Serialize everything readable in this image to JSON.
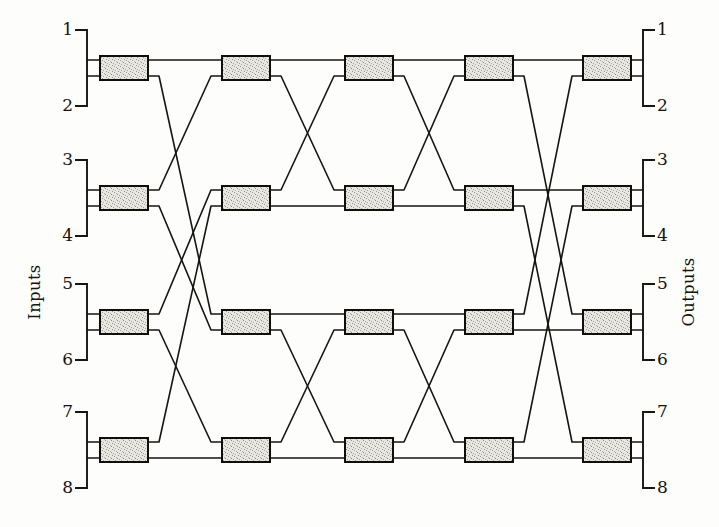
{
  "figure": {
    "kind": "benes-network",
    "stage_count": 5,
    "switches_per_stage": 4,
    "line_color": "#17150f",
    "box_fill": "#e9e7e1",
    "background": "#fdfdfc"
  },
  "labels": {
    "inputs_label": "Inputs",
    "outputs_label": "Outputs"
  },
  "inputs": [
    {
      "id": "in-1",
      "number": "1"
    },
    {
      "id": "in-2",
      "number": "2"
    },
    {
      "id": "in-3",
      "number": "3"
    },
    {
      "id": "in-4",
      "number": "4"
    },
    {
      "id": "in-5",
      "number": "5"
    },
    {
      "id": "in-6",
      "number": "6"
    },
    {
      "id": "in-7",
      "number": "7"
    },
    {
      "id": "in-8",
      "number": "8"
    }
  ],
  "outputs": [
    {
      "id": "out-1",
      "number": "1"
    },
    {
      "id": "out-2",
      "number": "2"
    },
    {
      "id": "out-3",
      "number": "3"
    },
    {
      "id": "out-4",
      "number": "4"
    },
    {
      "id": "out-5",
      "number": "5"
    },
    {
      "id": "out-6",
      "number": "6"
    },
    {
      "id": "out-7",
      "number": "7"
    },
    {
      "id": "out-8",
      "number": "8"
    }
  ],
  "geometry": {
    "stage_x": [
      124,
      246,
      369,
      489,
      607
    ],
    "row_y": [
      68,
      198,
      322,
      450
    ],
    "box_w": 48,
    "box_h": 24,
    "port_dy": 8,
    "input_bracket_x": 87,
    "output_bracket_x": 643,
    "input_label_x": 73,
    "output_label_x": 657,
    "bracket_arm": 12,
    "bracket_half_height": 38
  },
  "switches": [
    {
      "id": "s1-1",
      "stage": 1,
      "row": 1
    },
    {
      "id": "s1-2",
      "stage": 1,
      "row": 2
    },
    {
      "id": "s1-3",
      "stage": 1,
      "row": 3
    },
    {
      "id": "s1-4",
      "stage": 1,
      "row": 4
    },
    {
      "id": "s2-1",
      "stage": 2,
      "row": 1
    },
    {
      "id": "s2-2",
      "stage": 2,
      "row": 2
    },
    {
      "id": "s2-3",
      "stage": 2,
      "row": 3
    },
    {
      "id": "s2-4",
      "stage": 2,
      "row": 4
    },
    {
      "id": "s3-1",
      "stage": 3,
      "row": 1
    },
    {
      "id": "s3-2",
      "stage": 3,
      "row": 2
    },
    {
      "id": "s3-3",
      "stage": 3,
      "row": 3
    },
    {
      "id": "s3-4",
      "stage": 3,
      "row": 4
    },
    {
      "id": "s4-1",
      "stage": 4,
      "row": 1
    },
    {
      "id": "s4-2",
      "stage": 4,
      "row": 2
    },
    {
      "id": "s4-3",
      "stage": 4,
      "row": 3
    },
    {
      "id": "s4-4",
      "stage": 4,
      "row": 4
    },
    {
      "id": "s5-1",
      "stage": 5,
      "row": 1
    },
    {
      "id": "s5-2",
      "stage": 5,
      "row": 2
    },
    {
      "id": "s5-3",
      "stage": 5,
      "row": 3
    },
    {
      "id": "s5-4",
      "stage": 5,
      "row": 4
    }
  ],
  "input_links": [
    {
      "input": 1,
      "to_stage": 1,
      "to_row": 1,
      "to_port": "top"
    },
    {
      "input": 2,
      "to_stage": 1,
      "to_row": 1,
      "to_port": "bottom"
    },
    {
      "input": 3,
      "to_stage": 1,
      "to_row": 2,
      "to_port": "top"
    },
    {
      "input": 4,
      "to_stage": 1,
      "to_row": 2,
      "to_port": "bottom"
    },
    {
      "input": 5,
      "to_stage": 1,
      "to_row": 3,
      "to_port": "top"
    },
    {
      "input": 6,
      "to_stage": 1,
      "to_row": 3,
      "to_port": "bottom"
    },
    {
      "input": 7,
      "to_stage": 1,
      "to_row": 4,
      "to_port": "top"
    },
    {
      "input": 8,
      "to_stage": 1,
      "to_row": 4,
      "to_port": "bottom"
    }
  ],
  "output_links": [
    {
      "output": 1,
      "from_stage": 5,
      "from_row": 1,
      "from_port": "top"
    },
    {
      "output": 2,
      "from_stage": 5,
      "from_row": 1,
      "from_port": "bottom"
    },
    {
      "output": 3,
      "from_stage": 5,
      "from_row": 2,
      "from_port": "top"
    },
    {
      "output": 4,
      "from_stage": 5,
      "from_row": 2,
      "from_port": "bottom"
    },
    {
      "output": 5,
      "from_stage": 5,
      "from_row": 3,
      "from_port": "top"
    },
    {
      "output": 6,
      "from_stage": 5,
      "from_row": 3,
      "from_port": "bottom"
    },
    {
      "output": 7,
      "from_stage": 5,
      "from_row": 4,
      "from_port": "top"
    },
    {
      "output": 8,
      "from_stage": 5,
      "from_row": 4,
      "from_port": "bottom"
    }
  ],
  "links": [
    {
      "from": [
        1,
        1,
        "top"
      ],
      "to": [
        2,
        1,
        "top"
      ]
    },
    {
      "from": [
        1,
        1,
        "bottom"
      ],
      "to": [
        2,
        3,
        "top"
      ]
    },
    {
      "from": [
        1,
        2,
        "top"
      ],
      "to": [
        2,
        1,
        "bottom"
      ]
    },
    {
      "from": [
        1,
        2,
        "bottom"
      ],
      "to": [
        2,
        3,
        "bottom"
      ]
    },
    {
      "from": [
        1,
        3,
        "top"
      ],
      "to": [
        2,
        2,
        "top"
      ]
    },
    {
      "from": [
        1,
        3,
        "bottom"
      ],
      "to": [
        2,
        4,
        "top"
      ]
    },
    {
      "from": [
        1,
        4,
        "top"
      ],
      "to": [
        2,
        2,
        "bottom"
      ]
    },
    {
      "from": [
        1,
        4,
        "bottom"
      ],
      "to": [
        2,
        4,
        "bottom"
      ]
    },
    {
      "from": [
        2,
        1,
        "top"
      ],
      "to": [
        3,
        1,
        "top"
      ]
    },
    {
      "from": [
        2,
        1,
        "bottom"
      ],
      "to": [
        3,
        2,
        "top"
      ]
    },
    {
      "from": [
        2,
        2,
        "top"
      ],
      "to": [
        3,
        1,
        "bottom"
      ]
    },
    {
      "from": [
        2,
        2,
        "bottom"
      ],
      "to": [
        3,
        2,
        "bottom"
      ]
    },
    {
      "from": [
        2,
        3,
        "top"
      ],
      "to": [
        3,
        3,
        "top"
      ]
    },
    {
      "from": [
        2,
        3,
        "bottom"
      ],
      "to": [
        3,
        4,
        "top"
      ]
    },
    {
      "from": [
        2,
        4,
        "top"
      ],
      "to": [
        3,
        3,
        "bottom"
      ]
    },
    {
      "from": [
        2,
        4,
        "bottom"
      ],
      "to": [
        3,
        4,
        "bottom"
      ]
    },
    {
      "from": [
        3,
        1,
        "top"
      ],
      "to": [
        4,
        1,
        "top"
      ]
    },
    {
      "from": [
        3,
        1,
        "bottom"
      ],
      "to": [
        4,
        2,
        "top"
      ]
    },
    {
      "from": [
        3,
        2,
        "top"
      ],
      "to": [
        4,
        1,
        "bottom"
      ]
    },
    {
      "from": [
        3,
        2,
        "bottom"
      ],
      "to": [
        4,
        2,
        "bottom"
      ]
    },
    {
      "from": [
        3,
        3,
        "top"
      ],
      "to": [
        4,
        3,
        "top"
      ]
    },
    {
      "from": [
        3,
        3,
        "bottom"
      ],
      "to": [
        4,
        4,
        "top"
      ]
    },
    {
      "from": [
        3,
        4,
        "top"
      ],
      "to": [
        4,
        3,
        "bottom"
      ]
    },
    {
      "from": [
        3,
        4,
        "bottom"
      ],
      "to": [
        4,
        4,
        "bottom"
      ]
    },
    {
      "from": [
        4,
        1,
        "top"
      ],
      "to": [
        5,
        1,
        "top"
      ]
    },
    {
      "from": [
        4,
        1,
        "bottom"
      ],
      "to": [
        5,
        3,
        "top"
      ]
    },
    {
      "from": [
        4,
        2,
        "top"
      ],
      "to": [
        5,
        2,
        "top"
      ]
    },
    {
      "from": [
        4,
        2,
        "bottom"
      ],
      "to": [
        5,
        4,
        "top"
      ]
    },
    {
      "from": [
        4,
        3,
        "top"
      ],
      "to": [
        5,
        1,
        "bottom"
      ]
    },
    {
      "from": [
        4,
        3,
        "bottom"
      ],
      "to": [
        5,
        3,
        "bottom"
      ]
    },
    {
      "from": [
        4,
        4,
        "top"
      ],
      "to": [
        5,
        2,
        "bottom"
      ]
    },
    {
      "from": [
        4,
        4,
        "bottom"
      ],
      "to": [
        5,
        4,
        "bottom"
      ]
    }
  ]
}
